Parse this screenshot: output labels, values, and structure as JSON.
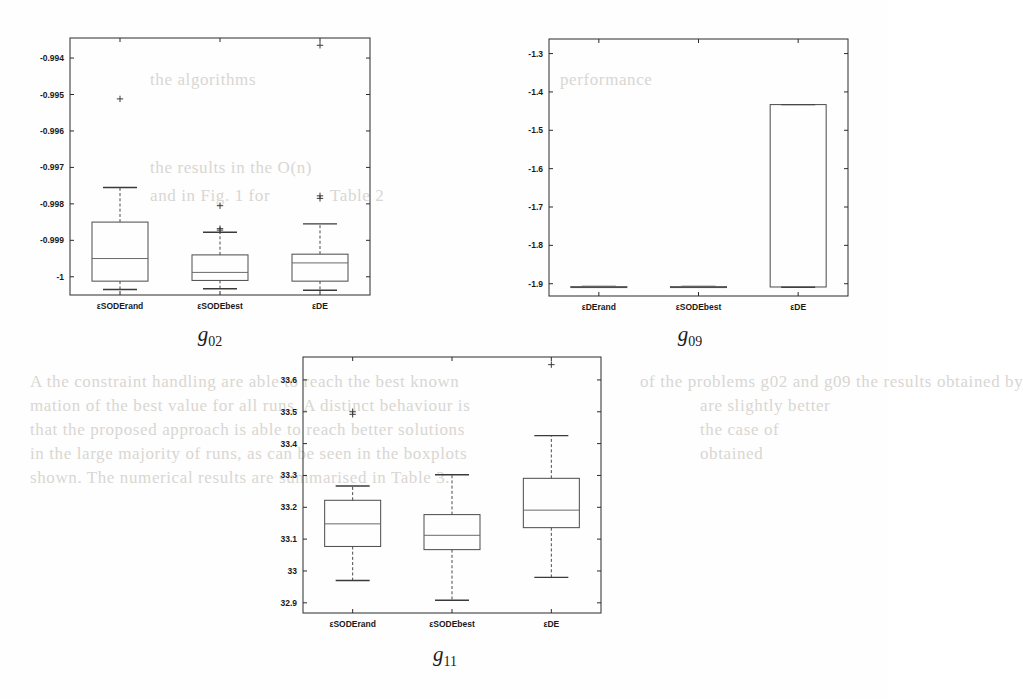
{
  "page": {
    "background": "#fefefe",
    "ink": "#1a1a1a",
    "bleed_color": "#d9d6d2",
    "bleed_lines": [
      {
        "text": "the results in the  O(n)",
        "x": 150,
        "y": 158
      },
      {
        "text": "and in Fig. 1 for",
        "x": 150,
        "y": 186
      },
      {
        "text": "Table 2",
        "x": 330,
        "y": 186
      },
      {
        "text": "performance",
        "x": 560,
        "y": 70
      },
      {
        "text": "the algorithms",
        "x": 150,
        "y": 70
      },
      {
        "text": "A  the constraint  handling  are  able  to  reach  the  best  known",
        "x": 30,
        "y": 372
      },
      {
        "text": "mation  of  the  best  value  for  all  runs.  A  distinct  behaviour  is",
        "x": 30,
        "y": 396
      },
      {
        "text": "that  the  proposed  approach  is  able  to  reach  better  solutions",
        "x": 30,
        "y": 420
      },
      {
        "text": "in  the  large  majority  of  runs,  as  can  be  seen  in  the  boxplots",
        "x": 30,
        "y": 444
      },
      {
        "text": "shown.  The  numerical  results  are  summarised  in  Table  3.",
        "x": 30,
        "y": 468
      },
      {
        "text": "of  the  problems  g02  and  g09  the  results  obtained  by",
        "x": 640,
        "y": 372
      },
      {
        "text": "are  slightly  better",
        "x": 700,
        "y": 396
      },
      {
        "text": "the  case  of",
        "x": 700,
        "y": 420
      },
      {
        "text": "obtained",
        "x": 700,
        "y": 444
      }
    ]
  },
  "chart_data": [
    {
      "id": "g02",
      "type": "box",
      "title": "g02",
      "xlabel": "",
      "ylabel": "",
      "ylim": [
        -1.0005,
        -0.99345
      ],
      "yticks": [
        -0.994,
        -0.995,
        -0.996,
        -0.997,
        -0.998,
        -0.999,
        -1
      ],
      "ytick_labels": [
        "-0.994",
        "-0.995",
        "-0.996",
        "-0.997",
        "-0.998",
        "-0.999",
        "-1"
      ],
      "categories": [
        "εSODErand",
        "εSODEbest",
        "εDE"
      ],
      "grid": false,
      "legend": null,
      "boxes": [
        {
          "category": "εSODErand",
          "whisker_low": -1.00035,
          "q1": -1.00012,
          "median": -0.9995,
          "q3": -0.9985,
          "whisker_high": -0.99755,
          "outliers": [
            -0.99512
          ]
        },
        {
          "category": "εSODEbest",
          "whisker_low": -1.00033,
          "q1": -1.0001,
          "median": -0.99988,
          "q3": -0.9994,
          "whisker_high": -0.99878,
          "outliers": [
            -0.99872,
            -0.99868,
            -0.99805
          ]
        },
        {
          "category": "εDE",
          "whisker_low": -1.00037,
          "q1": -1.00012,
          "median": -0.99962,
          "q3": -0.99938,
          "whisker_high": -0.99855,
          "outliers": [
            -0.99785,
            -0.99778,
            -0.99365
          ]
        }
      ]
    },
    {
      "id": "g09",
      "type": "box",
      "title": "g09",
      "xlabel": "",
      "ylabel": "",
      "ylim": [
        -1.932,
        -1.262
      ],
      "yticks": [
        -1.3,
        -1.4,
        -1.5,
        -1.6,
        -1.7,
        -1.8,
        -1.9
      ],
      "ytick_labels": [
        "-1.3",
        "-1.4",
        "-1.5",
        "-1.6",
        "-1.7",
        "-1.8",
        "-1.9"
      ],
      "categories": [
        "εDErand",
        "εSODEbest",
        "εDE"
      ],
      "grid": false,
      "legend": null,
      "boxes": [
        {
          "category": "εDErand",
          "whisker_low": -1.9085,
          "q1": -1.908,
          "median": -1.9077,
          "q3": -1.9074,
          "whisker_high": -1.907,
          "outliers": []
        },
        {
          "category": "εSODEbest",
          "whisker_low": -1.9088,
          "q1": -1.9082,
          "median": -1.9078,
          "q3": -1.9074,
          "whisker_high": -1.9068,
          "outliers": []
        },
        {
          "category": "εDE",
          "whisker_low": -1.909,
          "q1": -1.9085,
          "median": null,
          "q3": -1.433,
          "whisker_high": -1.433,
          "outliers": []
        }
      ]
    },
    {
      "id": "g11",
      "type": "box",
      "title": "g11",
      "xlabel": "",
      "ylabel": "",
      "ylim": [
        32.868,
        33.672
      ],
      "yticks": [
        33.6,
        33.5,
        33.4,
        33.3,
        33.2,
        33.1,
        33,
        32.9
      ],
      "ytick_labels": [
        "33.6",
        "33.5",
        "33.4",
        "33.3",
        "33.2",
        "33.1",
        "33",
        "32.9"
      ],
      "categories": [
        "εSODErand",
        "εSODEbest",
        "εDE"
      ],
      "grid": false,
      "legend": null,
      "boxes": [
        {
          "category": "εSODErand",
          "whisker_low": 32.97,
          "q1": 33.077,
          "median": 33.148,
          "q3": 33.222,
          "whisker_high": 33.267,
          "outliers": [
            33.492,
            33.5
          ]
        },
        {
          "category": "εSODEbest",
          "whisker_low": 32.908,
          "q1": 33.067,
          "median": 33.112,
          "q3": 33.177,
          "whisker_high": 33.302,
          "outliers": []
        },
        {
          "category": "εDE",
          "whisker_low": 32.98,
          "q1": 33.136,
          "median": 33.191,
          "q3": 33.291,
          "whisker_high": 33.425,
          "outliers": [
            33.648
          ]
        }
      ]
    }
  ]
}
